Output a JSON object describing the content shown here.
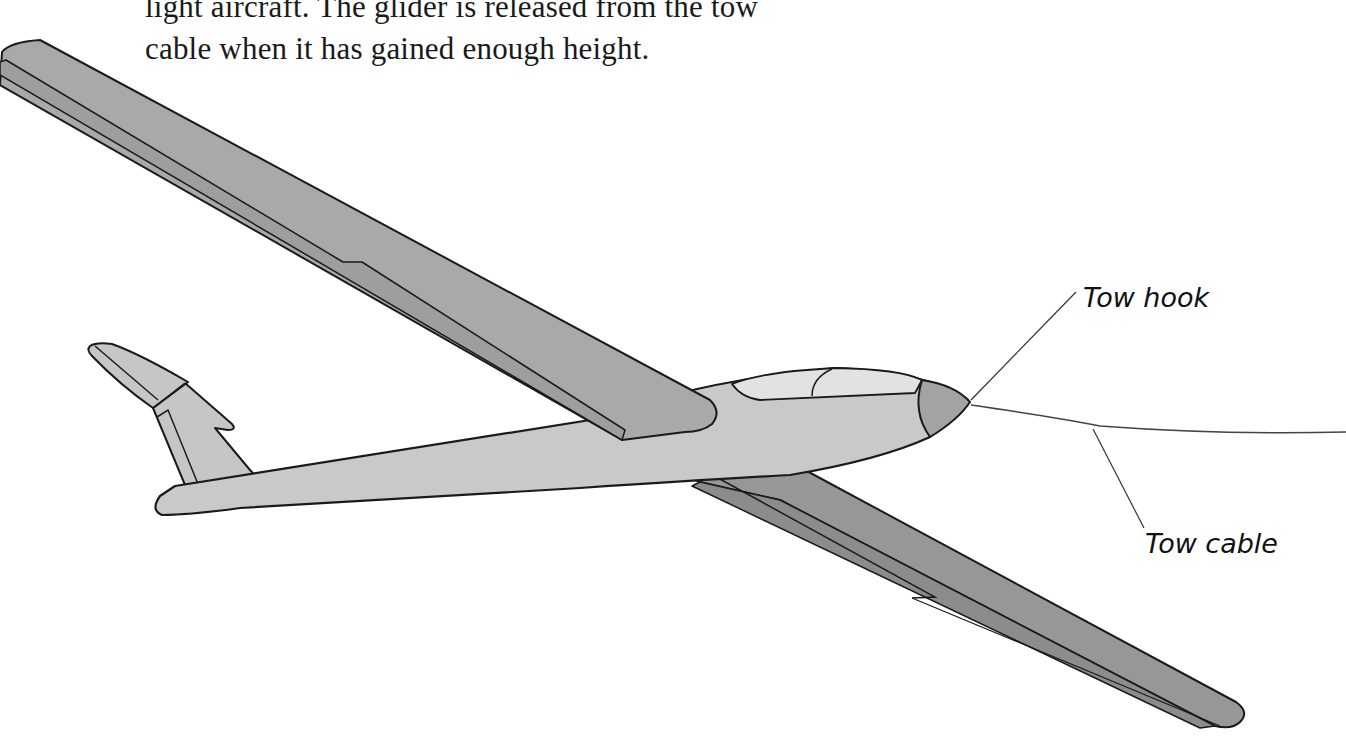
{
  "caption": {
    "line1": "light aircraft. The glider is released from the tow",
    "line2": "cable when it has gained enough height."
  },
  "labels": {
    "tow_hook": "Tow hook",
    "tow_cable": "Tow cable"
  },
  "colors": {
    "background": "#ffffff",
    "outline": "#1a1a1a",
    "upper_wing": "#a9a9a9",
    "upper_wing_flap": "#9e9e9e",
    "lower_wing": "#979797",
    "lower_wing_flap": "#8c8c8c",
    "fuselage": "#c9c9c9",
    "tail": "#c6c6c6",
    "canopy": "#e2e2e2",
    "nose_cone": "#a3a3a3",
    "cable": "#444444"
  },
  "diagram": {
    "subject": "glider",
    "parts": [
      "upper wing",
      "lower wing",
      "fuselage",
      "tail fin",
      "tailplane",
      "canopy",
      "nose cone",
      "tow hook",
      "tow cable"
    ]
  }
}
